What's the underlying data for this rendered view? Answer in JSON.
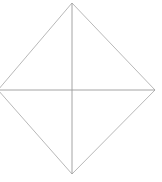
{
  "figure": {
    "type": "line-drawing",
    "canvas": {
      "width": 162,
      "height": 182,
      "background": "#ffffff"
    },
    "stroke": {
      "edge_color": "#b0b0b0",
      "diagonal_color": "#9a9a9a",
      "edge_width": 0.9,
      "diagonal_width": 0.9
    },
    "vertices": {
      "top": {
        "label": "top",
        "x": 72,
        "y": 3
      },
      "right": {
        "label": "right",
        "x": 155,
        "y": 90
      },
      "bottom": {
        "label": "bottom",
        "x": 72,
        "y": 174
      },
      "left": {
        "label": "left",
        "x": -2,
        "y": 90
      },
      "center": {
        "label": "center",
        "x": 72,
        "y": 90
      }
    },
    "paths": {
      "outline": "M 72,3 L 155,90 L 72,174 L -2,90 Z",
      "horizontal_diagonal": "M -2,90 L 155,90",
      "vertical_diagonal": "M 72,3 L 72,174"
    },
    "notes": {
      "left_vertex_clipped": "left vertex sits at the canvas edge and is clipped",
      "labels_visible": "none"
    }
  }
}
